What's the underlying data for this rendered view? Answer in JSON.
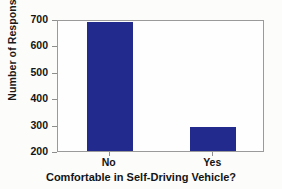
{
  "chart_data": {
    "type": "bar",
    "title": "",
    "xlabel": "Comfortable in Self-Driving Vehicle?",
    "ylabel": "Number of Responses",
    "categories": [
      "No",
      "Yes"
    ],
    "values": [
      690,
      290
    ],
    "ylim": [
      200,
      700
    ],
    "yticks": [
      200,
      300,
      400,
      500,
      600,
      700
    ],
    "ytick_labels": [
      "200",
      "300",
      "400",
      "500",
      "600",
      "700"
    ],
    "grid": false,
    "legend": null,
    "bar_color": "#232a8e",
    "plot_background": "#fefefe",
    "axis_color": "#9a9a9a"
  },
  "axis": {
    "y_title": "Number of Responses",
    "x_title": "Comfortable in Self-Driving Vehicle?"
  }
}
